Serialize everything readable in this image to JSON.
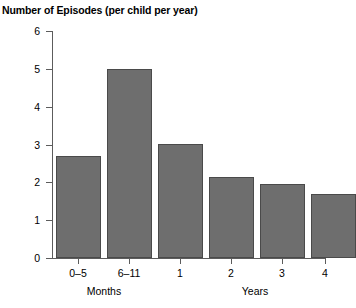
{
  "chart_data": {
    "type": "bar",
    "title": "Number of Episodes (per child per year)",
    "xlabel": "",
    "ylabel": "",
    "ylim": [
      0,
      6
    ],
    "yticks": [
      "0",
      "1",
      "2",
      "3",
      "4",
      "5",
      "6"
    ],
    "grid": false,
    "legend": "none",
    "categories": [
      "0–5",
      "6–11",
      "1",
      "2",
      "3",
      "4"
    ],
    "values": [
      2.7,
      5.0,
      3.0,
      2.15,
      1.95,
      1.7
    ],
    "group_labels": [
      {
        "label": "Months",
        "categories": [
          "0–5",
          "6–11"
        ]
      },
      {
        "label": "Years",
        "categories": [
          "1",
          "2",
          "3",
          "4"
        ]
      }
    ],
    "colors": {
      "bar_fill": "#6e6e6e",
      "bar_border": "#4a4a4a",
      "axis": "#5c5c5c",
      "background": "#ffffff",
      "text": "#000000"
    }
  }
}
